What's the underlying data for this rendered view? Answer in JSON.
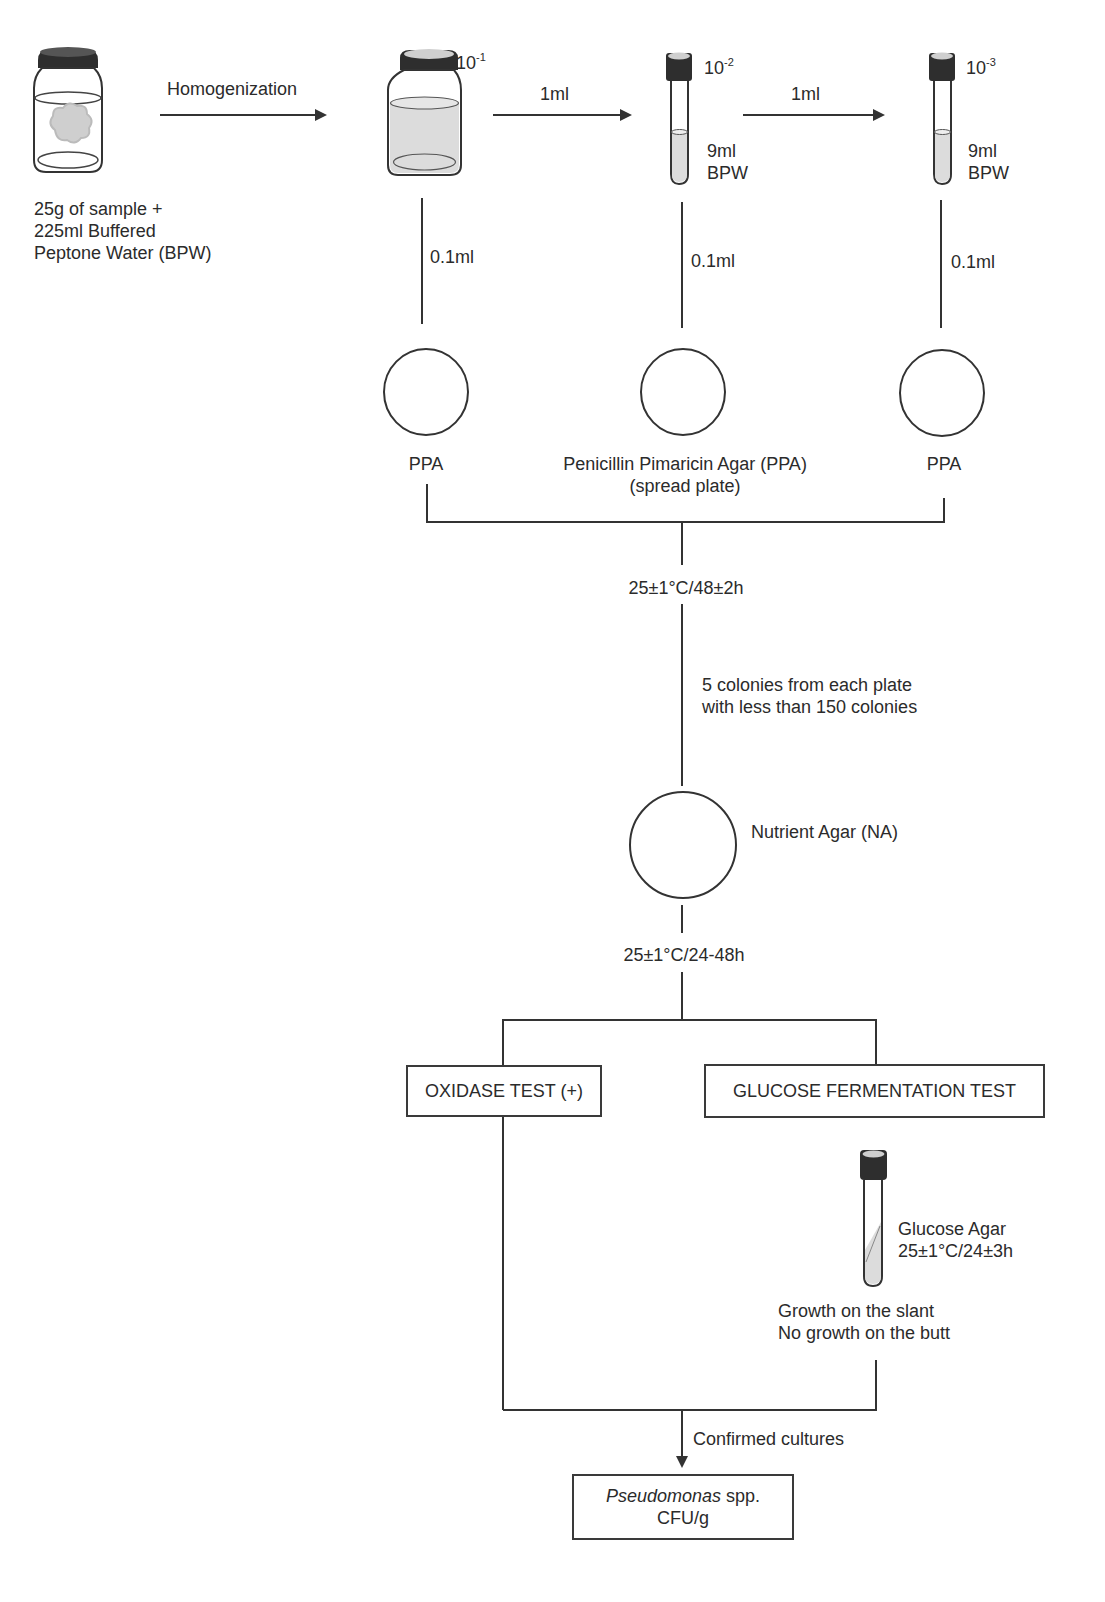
{
  "diagram": {
    "colors": {
      "line": "#3a3a3a",
      "cap": "#2e2e2e",
      "liquid": "#dcdcdc",
      "sample": "#cfcfcf"
    },
    "sample": {
      "label_lines": [
        "25g of sample +",
        "225ml Buffered",
        "Peptone Water (BPW)"
      ],
      "icon": "jar-with-sample-icon"
    },
    "steps": {
      "homogenization": "Homogenization",
      "transfer_1": "1ml",
      "transfer_2": "1ml"
    },
    "dilutions": [
      {
        "base": "10",
        "exp": "-1",
        "icon": "bottle-icon"
      },
      {
        "base": "10",
        "exp": "-2",
        "icon": "test-tube-icon",
        "medium_lines": [
          "9ml",
          "BPW"
        ]
      },
      {
        "base": "10",
        "exp": "-3",
        "icon": "test-tube-icon",
        "medium_lines": [
          "9ml",
          "BPW"
        ]
      }
    ],
    "inoculum": [
      "0.1ml",
      "0.1ml",
      "0.1ml"
    ],
    "plates": {
      "left": "PPA",
      "center_lines": [
        "Penicillin Pimaricin Agar (PPA)",
        "(spread plate)"
      ],
      "right": "PPA"
    },
    "incubation_1": "25±1°C/48±2h",
    "colony_pick_lines": [
      "5 colonies from each plate",
      "with less than 150 colonies"
    ],
    "nutrient_agar": "Nutrient Agar (NA)",
    "incubation_2": "25±1°C/24-48h",
    "tests": {
      "oxidase": "OXIDASE TEST (+)",
      "glucose": "GLUCOSE FERMENTATION TEST"
    },
    "glucose_agar": {
      "lines": [
        "Glucose Agar",
        "25±1°C/24±3h"
      ],
      "result_lines": [
        "Growth on the slant",
        "No growth on the butt"
      ]
    },
    "confirmed": "Confirmed cultures",
    "result": {
      "organism": "Pseudomonas",
      "suffix": " spp.",
      "unit": "CFU/g"
    }
  }
}
